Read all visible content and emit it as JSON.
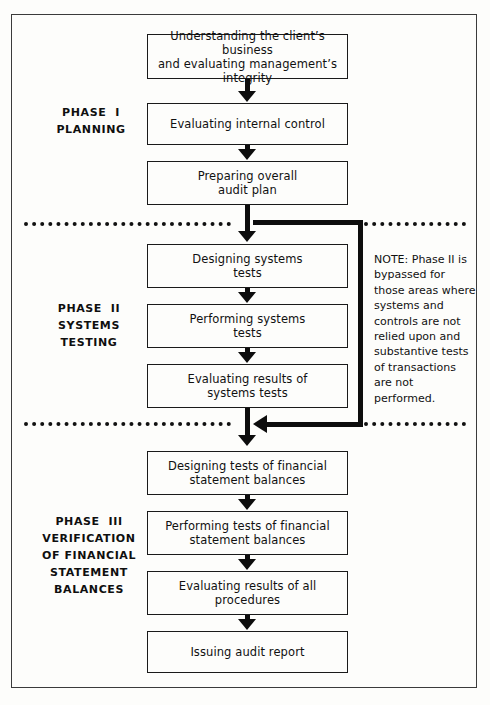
{
  "diagram": {
    "colors": {
      "ink": "#0d0d0d",
      "box_border": "#1a1a1a",
      "frame": "#3b3b3b",
      "background": "#fdfdfb"
    },
    "phases": [
      {
        "id": "phase-1",
        "lines": [
          "PHASE  I",
          "PLANNING"
        ],
        "steps": [
          {
            "id": "step-1",
            "lines": [
              "Understanding the client’s business",
              "and evaluating management’s integrity"
            ]
          },
          {
            "id": "step-2",
            "lines": [
              "Evaluating internal control"
            ]
          },
          {
            "id": "step-3",
            "lines": [
              "Preparing overall",
              "audit plan"
            ]
          }
        ]
      },
      {
        "id": "phase-2",
        "lines": [
          "PHASE  II",
          "SYSTEMS",
          "TESTING"
        ],
        "steps": [
          {
            "id": "step-4",
            "lines": [
              "Designing systems",
              "tests"
            ]
          },
          {
            "id": "step-5",
            "lines": [
              "Performing systems",
              "tests"
            ]
          },
          {
            "id": "step-6",
            "lines": [
              "Evaluating results of",
              "systems tests"
            ]
          }
        ]
      },
      {
        "id": "phase-3",
        "lines": [
          "PHASE  III",
          "VERIFICATION",
          "OF FINANCIAL",
          "STATEMENT",
          "BALANCES"
        ],
        "steps": [
          {
            "id": "step-7",
            "lines": [
              "Designing tests of financial",
              "statement balances"
            ]
          },
          {
            "id": "step-8",
            "lines": [
              "Performing tests of financial",
              "statement balances"
            ]
          },
          {
            "id": "step-9",
            "lines": [
              "Evaluating results of all",
              "procedures"
            ]
          },
          {
            "id": "step-10",
            "lines": [
              "Issuing audit report"
            ]
          }
        ]
      }
    ],
    "note": {
      "id": "bypass-note",
      "lines": [
        "NOTE: Phase II is",
        "bypassed for",
        "those areas where",
        "systems and",
        "controls are not",
        "relied upon and",
        "substantive tests",
        "of transactions",
        "are not",
        "performed."
      ]
    }
  }
}
